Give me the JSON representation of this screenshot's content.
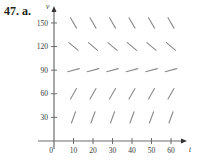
{
  "problem_label": "47. a.",
  "chart_data": {
    "type": "direction_field",
    "title": "",
    "xlabel": "t",
    "ylabel": "v",
    "xlim": [
      0,
      65
    ],
    "ylim": [
      0,
      160
    ],
    "x_ticks": [
      10,
      20,
      30,
      40,
      50,
      60
    ],
    "y_ticks": [
      30,
      60,
      90,
      120,
      150
    ],
    "origin_label": "0",
    "grid": false,
    "points_t": [
      10,
      20,
      30,
      40,
      50,
      60
    ],
    "rows": [
      {
        "v": 150,
        "slope_angle_deg": -60,
        "description": "steep negative slope"
      },
      {
        "v": 120,
        "slope_angle_deg": -40,
        "description": "negative slope"
      },
      {
        "v": 90,
        "slope_angle_deg": 15,
        "description": "slight positive slope"
      },
      {
        "v": 60,
        "slope_angle_deg": 60,
        "description": "positive slope"
      },
      {
        "v": 30,
        "slope_angle_deg": 70,
        "description": "steep positive slope"
      }
    ]
  },
  "colors": {
    "axis": "#6d6d6d",
    "segment": "#8a8a8a",
    "text": "#231f20"
  }
}
